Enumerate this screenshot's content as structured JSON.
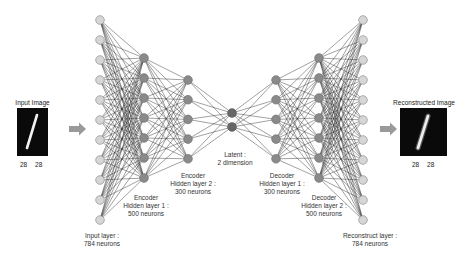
{
  "diagram": {
    "type": "autoencoder",
    "input_image": {
      "caption": "Input Image",
      "dims": "28 28"
    },
    "output_image": {
      "caption": "Reconstructed Image",
      "dims": "28 28"
    },
    "layers": [
      {
        "id": "input",
        "title": "Input layer :",
        "subtitle": "784 neurons",
        "nodes": 11,
        "x": 100,
        "y0": 20,
        "step": 20,
        "fill": "#d6d6d6",
        "stroke": "#9a9a9a"
      },
      {
        "id": "enc1",
        "title": "Encoder",
        "subtitle": "Hidden layer 1 :",
        "subtitle2": "500 neurons",
        "nodes": 7,
        "x": 144,
        "y0": 58,
        "step": 20,
        "fill": "#8a8a8a",
        "stroke": "#777777"
      },
      {
        "id": "enc2",
        "title": "Encoder",
        "subtitle": "Hidden layer 2 :",
        "subtitle2": "300 neurons",
        "nodes": 5,
        "x": 188,
        "y0": 80,
        "step": 19.7,
        "fill": "#8a8a8a",
        "stroke": "#777777"
      },
      {
        "id": "latent",
        "title": "Latent :",
        "subtitle": "2 dimension",
        "nodes": 2,
        "x": 232,
        "y0": 113,
        "step": 14,
        "fill": "#666666",
        "stroke": "#555555"
      },
      {
        "id": "dec1",
        "title": "Decoder",
        "subtitle": "Hidden layer 1 :",
        "subtitle2": "300 neurons",
        "nodes": 5,
        "x": 276,
        "y0": 80,
        "step": 19.7,
        "fill": "#8a8a8a",
        "stroke": "#777777"
      },
      {
        "id": "dec2",
        "title": "Decoder",
        "subtitle": "Hidden layer 2 :",
        "subtitle2": "500 neurons",
        "nodes": 7,
        "x": 319,
        "y0": 58,
        "step": 20,
        "fill": "#8a8a8a",
        "stroke": "#777777"
      },
      {
        "id": "output",
        "title": "Reconstruct layer :",
        "subtitle": "784 neurons",
        "nodes": 11,
        "x": 363,
        "y0": 20,
        "step": 20,
        "fill": "#d6d6d6",
        "stroke": "#9a9a9a"
      }
    ],
    "colors": {
      "edge": "#2a2a2a",
      "arrow": "#9a9a9a",
      "image_bg": "#0a0a0a"
    }
  }
}
